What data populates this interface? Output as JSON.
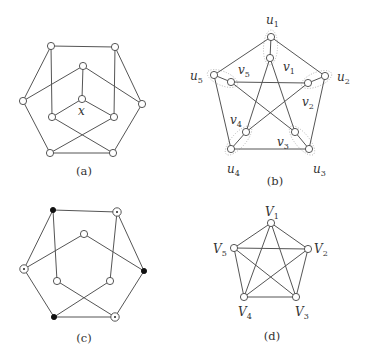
{
  "figure": {
    "panels": [
      {
        "id": "a",
        "caption": "(a)",
        "caption_pos": [
          84,
          175
        ],
        "node_style": "open",
        "nodes": [
          {
            "id": "tl",
            "x": 51,
            "y": 46
          },
          {
            "id": "tr",
            "x": 115,
            "y": 47
          },
          {
            "id": "it",
            "x": 83,
            "y": 66
          },
          {
            "id": "l",
            "x": 23,
            "y": 101
          },
          {
            "id": "r",
            "x": 142,
            "y": 104
          },
          {
            "id": "c",
            "x": 82,
            "y": 99
          },
          {
            "id": "il",
            "x": 52,
            "y": 117
          },
          {
            "id": "ir",
            "x": 114,
            "y": 117
          },
          {
            "id": "bl",
            "x": 50,
            "y": 153
          },
          {
            "id": "br",
            "x": 113,
            "y": 153
          }
        ],
        "edges": [
          [
            "tl",
            "tr"
          ],
          [
            "tl",
            "l"
          ],
          [
            "tl",
            "il"
          ],
          [
            "tr",
            "r"
          ],
          [
            "tr",
            "ir"
          ],
          [
            "it",
            "l"
          ],
          [
            "it",
            "r"
          ],
          [
            "it",
            "c"
          ],
          [
            "c",
            "il"
          ],
          [
            "c",
            "ir"
          ],
          [
            "l",
            "bl"
          ],
          [
            "r",
            "br"
          ],
          [
            "bl",
            "br"
          ],
          [
            "bl",
            "ir"
          ],
          [
            "il",
            "br"
          ]
        ],
        "labels": [
          {
            "text": "x",
            "sub": "",
            "x": 78,
            "y": 115
          }
        ]
      },
      {
        "id": "b",
        "caption": "(b)",
        "caption_pos": [
          275,
          185
        ],
        "node_style": "open",
        "nodes": [
          {
            "id": "u1",
            "x": 271,
            "y": 37
          },
          {
            "id": "v1",
            "x": 270,
            "y": 58
          },
          {
            "id": "u2",
            "x": 325,
            "y": 76
          },
          {
            "id": "v2",
            "x": 308,
            "y": 83
          },
          {
            "id": "u3",
            "x": 309,
            "y": 149
          },
          {
            "id": "v3",
            "x": 295,
            "y": 132
          },
          {
            "id": "u4",
            "x": 231,
            "y": 149
          },
          {
            "id": "v4",
            "x": 246,
            "y": 132
          },
          {
            "id": "u5",
            "x": 214,
            "y": 75
          },
          {
            "id": "v5",
            "x": 231,
            "y": 82
          }
        ],
        "edges": [
          [
            "u1",
            "u2"
          ],
          [
            "u2",
            "u3"
          ],
          [
            "u3",
            "u4"
          ],
          [
            "u4",
            "u5"
          ],
          [
            "u5",
            "u1"
          ],
          [
            "u1",
            "v1"
          ],
          [
            "u2",
            "v2"
          ],
          [
            "u3",
            "v3"
          ],
          [
            "u4",
            "v4"
          ],
          [
            "u5",
            "v5"
          ],
          [
            "v1",
            "v3"
          ],
          [
            "v3",
            "v5"
          ],
          [
            "v5",
            "v2"
          ],
          [
            "v2",
            "v4"
          ],
          [
            "v4",
            "v1"
          ]
        ],
        "groups": [
          [
            "u1",
            "v1"
          ],
          [
            "u2",
            "v2"
          ],
          [
            "u3",
            "v3"
          ],
          [
            "u4",
            "v4"
          ],
          [
            "u5",
            "v5"
          ]
        ],
        "labels": [
          {
            "text": "u",
            "sub": "1",
            "x": 266,
            "y": 24
          },
          {
            "text": "v",
            "sub": "1",
            "x": 283,
            "y": 71
          },
          {
            "text": "u",
            "sub": "2",
            "x": 337,
            "y": 81
          },
          {
            "text": "v",
            "sub": "2",
            "x": 302,
            "y": 106
          },
          {
            "text": "u",
            "sub": "3",
            "x": 313,
            "y": 173
          },
          {
            "text": "v",
            "sub": "3",
            "x": 277,
            "y": 146
          },
          {
            "text": "u",
            "sub": "4",
            "x": 227,
            "y": 173
          },
          {
            "text": "v",
            "sub": "4",
            "x": 230,
            "y": 124
          },
          {
            "text": "u",
            "sub": "5",
            "x": 190,
            "y": 80
          },
          {
            "text": "v",
            "sub": "5",
            "x": 238,
            "y": 74
          }
        ]
      },
      {
        "id": "c",
        "caption": "(c)",
        "caption_pos": [
          84,
          342
        ],
        "node_style": "mixed",
        "nodes": [
          {
            "id": "tl",
            "x": 53,
            "y": 210,
            "type": "filled"
          },
          {
            "id": "tr",
            "x": 117,
            "y": 212,
            "type": "dotted"
          },
          {
            "id": "it",
            "x": 84,
            "y": 234,
            "type": "open"
          },
          {
            "id": "l",
            "x": 24,
            "y": 269,
            "type": "dotted"
          },
          {
            "id": "r",
            "x": 144,
            "y": 271,
            "type": "filled"
          },
          {
            "id": "il",
            "x": 57,
            "y": 281,
            "type": "open"
          },
          {
            "id": "ir",
            "x": 110,
            "y": 281,
            "type": "open"
          },
          {
            "id": "bl",
            "x": 54,
            "y": 317,
            "type": "filled"
          },
          {
            "id": "br",
            "x": 115,
            "y": 317,
            "type": "dotted"
          }
        ],
        "edges": [
          [
            "tl",
            "tr"
          ],
          [
            "tl",
            "l"
          ],
          [
            "tl",
            "il"
          ],
          [
            "tr",
            "r"
          ],
          [
            "tr",
            "ir"
          ],
          [
            "it",
            "l"
          ],
          [
            "it",
            "r"
          ],
          [
            "l",
            "bl"
          ],
          [
            "r",
            "br"
          ],
          [
            "bl",
            "br"
          ],
          [
            "bl",
            "ir"
          ],
          [
            "il",
            "br"
          ]
        ],
        "labels": []
      },
      {
        "id": "d",
        "caption": "(d)",
        "caption_pos": [
          272,
          340
        ],
        "node_style": "open",
        "nodes": [
          {
            "id": "V1",
            "x": 271,
            "y": 223
          },
          {
            "id": "V2",
            "x": 308,
            "y": 249
          },
          {
            "id": "V3",
            "x": 296,
            "y": 297
          },
          {
            "id": "V4",
            "x": 244,
            "y": 297
          },
          {
            "id": "V5",
            "x": 234,
            "y": 248
          }
        ],
        "edges": [
          [
            "V1",
            "V2"
          ],
          [
            "V1",
            "V3"
          ],
          [
            "V1",
            "V4"
          ],
          [
            "V1",
            "V5"
          ],
          [
            "V2",
            "V3"
          ],
          [
            "V2",
            "V4"
          ],
          [
            "V2",
            "V5"
          ],
          [
            "V3",
            "V4"
          ],
          [
            "V3",
            "V5"
          ],
          [
            "V4",
            "V5"
          ]
        ],
        "labels": [
          {
            "text": "V",
            "sub": "1",
            "x": 265,
            "y": 216
          },
          {
            "text": "V",
            "sub": "2",
            "x": 314,
            "y": 253
          },
          {
            "text": "V",
            "sub": "3",
            "x": 295,
            "y": 316
          },
          {
            "text": "V",
            "sub": "4",
            "x": 238,
            "y": 316
          },
          {
            "text": "V",
            "sub": "5",
            "x": 213,
            "y": 253
          }
        ]
      }
    ]
  }
}
